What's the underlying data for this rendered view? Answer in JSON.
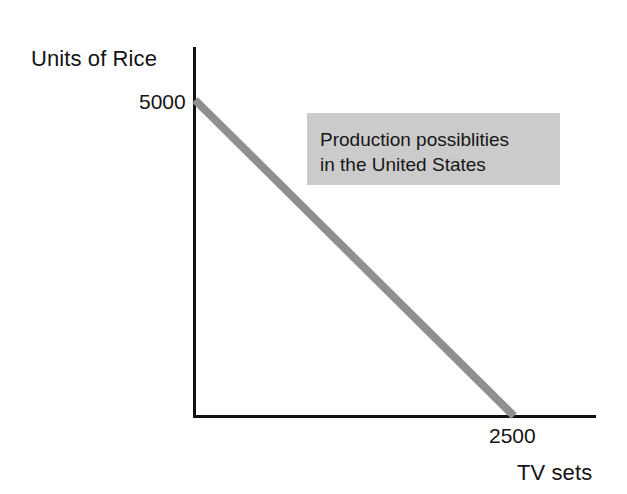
{
  "figure": {
    "background_color": "#ffffff",
    "axis_color": "#111111",
    "curve_color": "#8f8f8f",
    "annotation_bg_color": "#cbcbcb",
    "text_color": "#141414"
  },
  "annotation": {
    "line1": "Production possiblities",
    "line2": "in the United States"
  },
  "chart_data": {
    "type": "line",
    "title": "",
    "subtitle": "",
    "xlabel": "TV sets",
    "ylabel": "Units of Rice",
    "xlim": [
      0,
      2980
    ],
    "ylim": [
      0,
      6400
    ],
    "grid": false,
    "legend": null,
    "xticks": [
      2500
    ],
    "xtick_labels": [
      "2500"
    ],
    "yticks": [
      5000
    ],
    "ytick_labels": [
      "5000"
    ],
    "series": [
      {
        "name": "Production possibilities frontier",
        "style": "straight-line",
        "color": "#8f8f8f",
        "linewidth": 8,
        "x": [
          0,
          2500
        ],
        "y": [
          5000,
          0
        ]
      }
    ],
    "annotations": [
      {
        "text": "Production possiblities in the United States",
        "background": "#cbcbcb",
        "position": "upper-right"
      }
    ]
  }
}
